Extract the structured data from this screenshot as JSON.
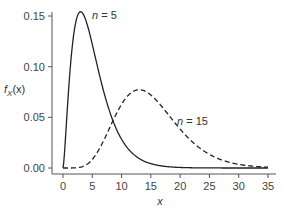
{
  "chart_data": {
    "type": "line",
    "title": "",
    "xlabel": "x",
    "ylabel": "f_X(x)",
    "xlim": [
      0,
      35
    ],
    "ylim": [
      0,
      0.15
    ],
    "x_ticks": [
      "0",
      "5",
      "10",
      "15",
      "20",
      "25",
      "30",
      "35"
    ],
    "y_ticks": [
      "0.00",
      "0.05",
      "0.10",
      "0.15"
    ],
    "grid": false,
    "legend": "inline annotations",
    "series": [
      {
        "name": "n = 5",
        "style": "solid",
        "x": [
          0,
          1,
          2,
          3,
          4,
          5,
          6,
          8,
          10,
          12,
          15,
          20,
          25,
          30,
          35
        ],
        "values": [
          0.0,
          0.081,
          0.138,
          0.154,
          0.144,
          0.122,
          0.096,
          0.053,
          0.028,
          0.014,
          0.005,
          0.0008,
          0.0001,
          0.0,
          0.0
        ]
      },
      {
        "name": "n = 15",
        "style": "dashed",
        "x": [
          0,
          2,
          4,
          6,
          8,
          10,
          12,
          13,
          14,
          16,
          18,
          20,
          22,
          25,
          28,
          30,
          35
        ],
        "values": [
          0.0,
          0.0004,
          0.004,
          0.017,
          0.037,
          0.057,
          0.074,
          0.078,
          0.077,
          0.071,
          0.058,
          0.044,
          0.031,
          0.016,
          0.008,
          0.005,
          0.001
        ]
      }
    ],
    "annotations": [
      {
        "text": "n = 5",
        "x": 5.5,
        "y": 0.151
      },
      {
        "text": "n = 15",
        "x": 19.5,
        "y": 0.048
      }
    ]
  },
  "labels": {
    "xlabel": "x",
    "ylabel_f": "f",
    "ylabel_sub": "X",
    "ylabel_arg": "(x)",
    "ann_n5_var": "n",
    "ann_n5_val": " = 5",
    "ann_n15_var": "n",
    "ann_n15_val": " = 15",
    "y_ticks": [
      "0.00",
      "0.05",
      "0.10",
      "0.15"
    ],
    "x_ticks": [
      "0",
      "5",
      "10",
      "15",
      "20",
      "25",
      "30",
      "35"
    ]
  }
}
